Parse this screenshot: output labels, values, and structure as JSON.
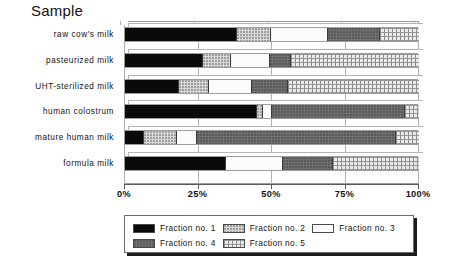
{
  "chart_data": {
    "type": "bar",
    "orientation": "horizontal",
    "stacked": true,
    "normalized": "100%",
    "title": "Sample",
    "xlabel": "",
    "ylabel": "Sample",
    "xlim": [
      0,
      100
    ],
    "xticks": [
      "0%",
      "25%",
      "50%",
      "75%",
      "100%"
    ],
    "xtick_values": [
      0,
      25,
      50,
      75,
      100
    ],
    "grid": true,
    "legend_position": "bottom",
    "categories": [
      "raw cow's milk",
      "pasteurized milk",
      "UHT-sterilized milk",
      "human colostrum",
      "mature human milk",
      "formula milk"
    ],
    "series": [
      {
        "name": "Fraction no. 1",
        "pattern": "solid-black",
        "color": "#0a0a0a",
        "values": [
          37.8,
          26.2,
          18.0,
          44.5,
          6.1,
          34.0
        ]
      },
      {
        "name": "Fraction no. 2",
        "pattern": "light-dotted",
        "color": "#d8d8d8",
        "values": [
          11.5,
          9.5,
          10.2,
          2.1,
          11.2,
          0.0
        ]
      },
      {
        "name": "Fraction no. 3",
        "pattern": "white",
        "color": "#fbfbfb",
        "values": [
          19.4,
          13.3,
          14.8,
          3.1,
          6.8,
          19.4
        ]
      },
      {
        "name": "Fraction no. 4",
        "pattern": "dark-gray-dotted",
        "color": "#6f6f6f",
        "values": [
          17.7,
          7.0,
          12.0,
          45.2,
          67.9,
          17.0
        ]
      },
      {
        "name": "Fraction no. 5",
        "pattern": "cross-hatched",
        "color": "#eaeaea",
        "values": [
          13.6,
          44.0,
          45.0,
          5.1,
          8.0,
          29.6
        ]
      }
    ]
  },
  "axis": {
    "tick_labels": [
      "0%",
      "25%",
      "50%",
      "75%",
      "100%"
    ]
  },
  "legend": {
    "entries": [
      {
        "label": "Fraction no. 1"
      },
      {
        "label": "Fraction no. 2"
      },
      {
        "label": "Fraction no. 3"
      },
      {
        "label": "Fraction no. 4"
      },
      {
        "label": "Fraction no. 5"
      }
    ]
  }
}
